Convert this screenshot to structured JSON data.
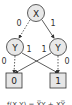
{
  "diagram": {
    "type": "binary-decision-diagram",
    "nodes": {
      "root": {
        "label": "X"
      },
      "left": {
        "label": "Y"
      },
      "right": {
        "label": "Y"
      }
    },
    "terminals": {
      "zero": {
        "label": "0"
      },
      "one": {
        "label": "1"
      }
    },
    "edge_labels": {
      "root_low": "0",
      "root_high": "1",
      "left_low": "0",
      "left_high": "1",
      "right_high": "1",
      "right_low": "0"
    },
    "colors": {
      "node_fill": "#e8e8e8",
      "terminal_fill": "#e6e6e6",
      "stroke": "#333333"
    },
    "caption": "f(X,Y) = X̅Y + XY̅"
  }
}
